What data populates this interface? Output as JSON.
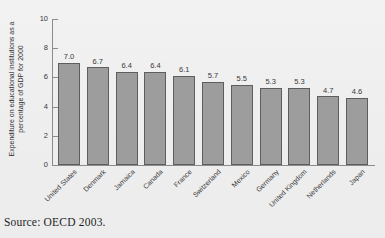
{
  "chart_data": {
    "type": "bar",
    "title": "",
    "xlabel": "",
    "ylabel": "Expenditure on educational institutions as a percentage of GDP for 2000",
    "ylim": [
      0,
      10
    ],
    "yticks": [
      0,
      2,
      4,
      6,
      8,
      10
    ],
    "ytick_labels": [
      "0",
      "2",
      "4",
      "6",
      "8",
      "10"
    ],
    "grid": false,
    "legend": "none",
    "bar_color": "#9d9d9d",
    "bar_edge_color": "#5e5e5e",
    "categories": [
      "United States",
      "Denmark",
      "Jamaica",
      "Canada",
      "France",
      "Switzerland",
      "Mexico",
      "Germany",
      "United Kingdom",
      "Netherlands",
      "Japan"
    ],
    "values": [
      7.0,
      6.7,
      6.4,
      6.4,
      6.1,
      5.7,
      5.5,
      5.3,
      5.3,
      4.7,
      4.6
    ],
    "value_labels": [
      "7.0",
      "6.7",
      "6.4",
      "6.4",
      "6.1",
      "5.7",
      "5.5",
      "5.3",
      "5.3",
      "4.7",
      "4.6"
    ]
  },
  "source": {
    "note": "Source: OECD 2003."
  }
}
